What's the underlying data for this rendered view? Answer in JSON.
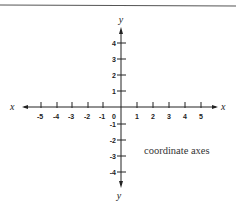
{
  "figure": {
    "caption": "coordinate axes",
    "x_axis": {
      "label_left": "x",
      "label_right": "x",
      "ticks": [
        "-5",
        "-4",
        "-3",
        "-2",
        "-1",
        "0",
        "1",
        "2",
        "3",
        "4",
        "5"
      ]
    },
    "y_axis": {
      "label_top": "y",
      "label_bottom": "y",
      "ticks_positive": [
        "4",
        "3",
        "2",
        "1"
      ],
      "ticks_negative": [
        "-1",
        "-2",
        "-3",
        "-4"
      ]
    },
    "colors": {
      "line": "#222222",
      "rule": "#555555",
      "background": "#ffffff"
    }
  }
}
